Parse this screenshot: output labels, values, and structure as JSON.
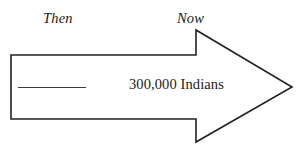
{
  "diagram": {
    "type": "arrow-comparison",
    "background_color": "#ffffff",
    "stroke_color": "#222222",
    "text_color": "#1a1a1a",
    "labels": {
      "then": "Then",
      "now": "Now"
    },
    "arrow": {
      "body_text": "300,000 Indians",
      "blank_line": "",
      "icon_name": "right-pointing-arrow",
      "points": "11,55 196,55 196,30 292,87 196,142 196,119 11,119"
    }
  }
}
